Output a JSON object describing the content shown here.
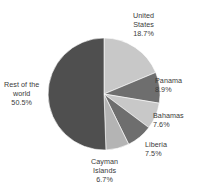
{
  "chart_data": {
    "type": "pie",
    "title": "",
    "subtitle": "",
    "xlabel": "",
    "ylabel": "",
    "legend_position": "none",
    "grid": false,
    "start_angle_deg": 0,
    "direction": "clockwise",
    "categories": [
      "United States",
      "Panama",
      "Bahamas",
      "Liberia",
      "Cayman Islands",
      "Rest of the world"
    ],
    "values": [
      18.7,
      8.9,
      7.6,
      7.5,
      6.7,
      50.5
    ],
    "value_unit": "%",
    "slices": [
      {
        "name": "United States",
        "value": 18.7,
        "value_text": "18.7%",
        "color": "#c8c8c8",
        "label_lines": [
          "United",
          "States"
        ],
        "label_value": "18.7%"
      },
      {
        "name": "Panama",
        "value": 8.9,
        "value_text": "8.9%",
        "color": "#6e6e6e",
        "label_lines": [
          "Panama"
        ],
        "label_value": "8.9%"
      },
      {
        "name": "Bahamas",
        "value": 7.6,
        "value_text": "7.6%",
        "color": "#c8c8c8",
        "label_lines": [
          "Bahamas"
        ],
        "label_value": "7.6%"
      },
      {
        "name": "Liberia",
        "value": 7.5,
        "value_text": "7.5%",
        "color": "#6e6e6e",
        "label_lines": [
          "Liberia"
        ],
        "label_value": "7.5%"
      },
      {
        "name": "Cayman Islands",
        "value": 6.7,
        "value_text": "6.7%",
        "color": "#b4b4b4",
        "label_lines": [
          "Cayman",
          "Islands"
        ],
        "label_value": "6.7%"
      },
      {
        "name": "Rest of the world",
        "value": 50.5,
        "value_text": "50.5%",
        "color": "#4f4f4f",
        "label_lines": [
          "Rest of the",
          "world"
        ],
        "label_value": "50.5%"
      }
    ],
    "colors": {
      "united_states": "#c8c8c8",
      "panama": "#6e6e6e",
      "bahamas": "#c8c8c8",
      "liberia": "#6e6e6e",
      "cayman_islands": "#b4b4b4",
      "rest_of_the_world": "#4f4f4f",
      "background": "#ffffff",
      "label_text": "#3a3a3a"
    }
  },
  "labels": {
    "united_states": {
      "line1": "United",
      "line2": "States",
      "value": "18.7%"
    },
    "panama": {
      "line1": "Panama",
      "value": "8.9%"
    },
    "bahamas": {
      "line1": "Bahamas",
      "value": "7.6%"
    },
    "liberia": {
      "line1": "Liberia",
      "value": "7.5%"
    },
    "cayman_islands": {
      "line1": "Cayman",
      "line2": "Islands",
      "value": "6.7%"
    },
    "rest_of_the_world": {
      "line1": "Rest of the",
      "line2": "world",
      "value": "50.5%"
    }
  }
}
